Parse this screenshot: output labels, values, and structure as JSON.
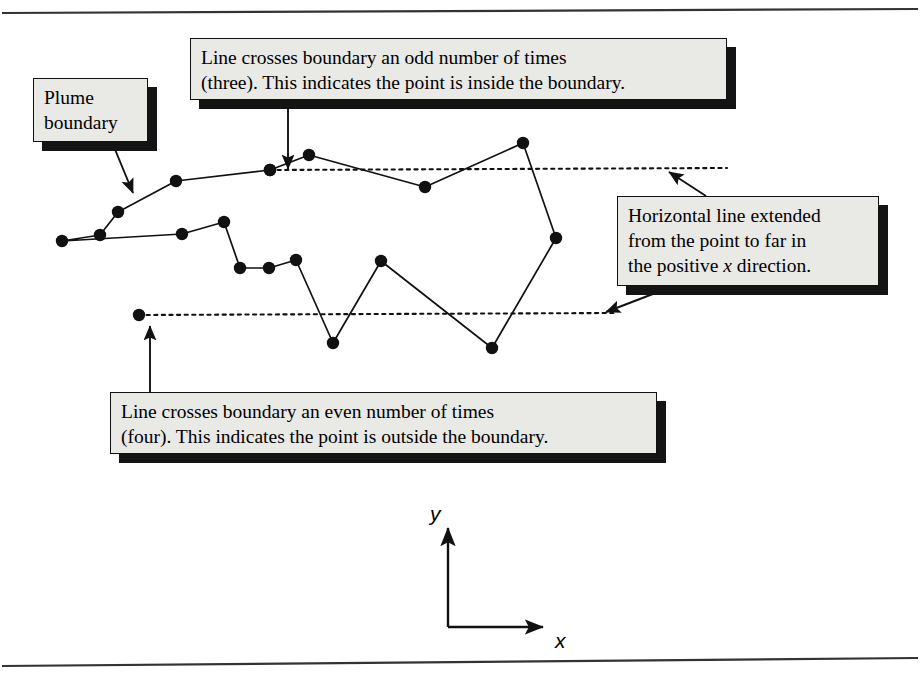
{
  "figure": {
    "frame": {
      "color": "#222222"
    }
  },
  "callouts": [
    {
      "name": "plume-boundary-callout",
      "text": "Plume\nboundary",
      "x": 33,
      "y": 78,
      "w": 115,
      "h": 64
    },
    {
      "name": "odd-crossings-callout",
      "text": "Line crosses boundary an odd number of times\n(three).  This indicates the point is inside the boundary.",
      "x": 190,
      "y": 38,
      "w": 537,
      "h": 62
    },
    {
      "name": "horizontal-line-callout",
      "text_line1": "Horizontal line extended",
      "text_line2": "from the point to far in",
      "text_line3_pre": "the positive ",
      "text_line3_italic": "x",
      "text_line3_post": " direction.",
      "x": 617,
      "y": 196,
      "w": 262,
      "h": 90
    },
    {
      "name": "even-crossings-callout",
      "text": "Line crosses boundary an even number of times\n(four).  This indicates the point is outside the boundary.",
      "x": 110,
      "y": 392,
      "w": 547,
      "h": 62
    }
  ],
  "axes": {
    "x_label": "x",
    "y_label": "y",
    "origin": {
      "x": 448,
      "y": 627
    },
    "y_tip": {
      "x": 448,
      "y": 528
    },
    "x_tip": {
      "x": 543,
      "y": 627
    }
  },
  "chart_data": {
    "type": "scatter",
    "xlabel": "x",
    "ylabel": "y",
    "grid": false,
    "legend": null,
    "series": [
      {
        "name": "plume-boundary-polygon",
        "closed": true,
        "marker": "filled-circle",
        "points": [
          [
            62,
            241
          ],
          [
            100,
            235
          ],
          [
            118,
            212
          ],
          [
            176,
            181
          ],
          [
            270,
            170
          ],
          [
            309,
            155
          ],
          [
            425,
            187
          ],
          [
            523,
            143
          ],
          [
            556,
            238
          ],
          [
            492,
            348
          ],
          [
            381,
            261
          ],
          [
            333,
            343
          ],
          [
            296,
            260
          ],
          [
            269,
            268
          ],
          [
            240,
            268
          ],
          [
            224,
            222
          ],
          [
            182,
            234
          ]
        ]
      }
    ],
    "rays": [
      {
        "name": "inside-test-ray",
        "from": [
          270,
          170
        ],
        "to": [
          727,
          168
        ],
        "style": "dotted",
        "crossings": 3,
        "result": "inside"
      },
      {
        "name": "outside-test-ray",
        "from": [
          139,
          315
        ],
        "to": [
          616,
          313
        ],
        "style": "dotted",
        "crossings": 4,
        "result": "outside"
      }
    ]
  }
}
